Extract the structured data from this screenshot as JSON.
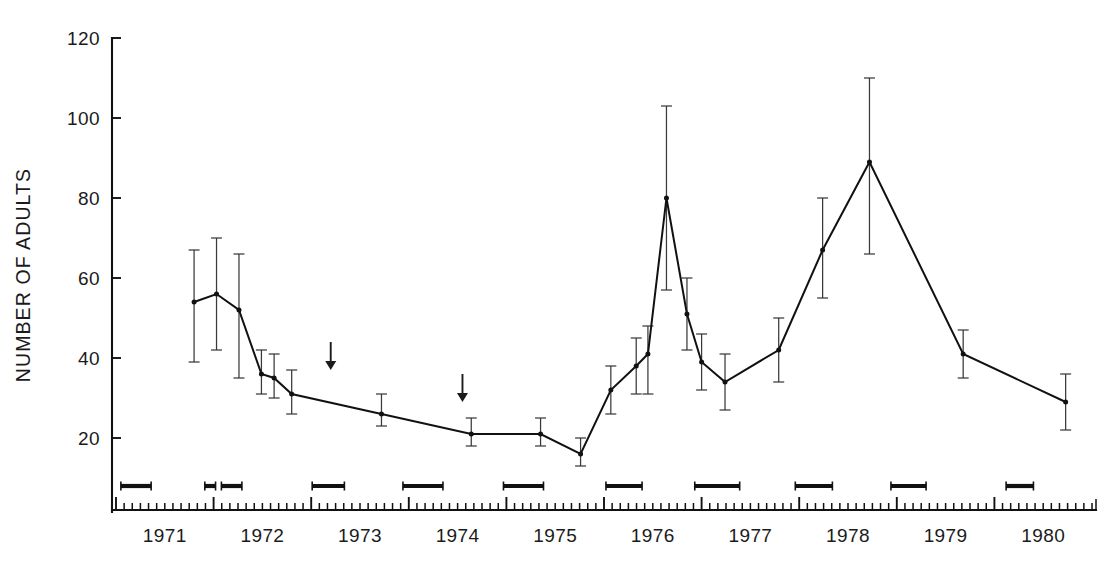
{
  "chart_data": {
    "type": "line",
    "title": "",
    "xlabel": "",
    "ylabel": "NUMBER OF ADULTS",
    "ylim": [
      0,
      120
    ],
    "xlim": [
      1971.0,
      1981.0
    ],
    "grid": false,
    "legend": null,
    "y_ticks": [
      0,
      20,
      40,
      60,
      80,
      100,
      120
    ],
    "y_tick_labels": [
      "",
      "20",
      "40",
      "60",
      "80",
      "100",
      "120"
    ],
    "x_ticks": [
      1971,
      1972,
      1973,
      1974,
      1975,
      1976,
      1977,
      1978,
      1979,
      1980
    ],
    "x_tick_labels": [
      "1971",
      "1972",
      "1973",
      "1974",
      "1975",
      "1976",
      "1977",
      "1978",
      "1979",
      "1980"
    ],
    "x_minor_tick_interval_months": 1,
    "series": [
      {
        "name": "Number of adults",
        "marker": "filled-circle",
        "error_type": "95% confidence interval",
        "points": [
          {
            "x": 1971.8,
            "y": 54,
            "yerr_low": 39,
            "yerr_high": 67
          },
          {
            "x": 1972.03,
            "y": 56,
            "yerr_low": 42,
            "yerr_high": 70
          },
          {
            "x": 1972.26,
            "y": 52,
            "yerr_low": 35,
            "yerr_high": 66
          },
          {
            "x": 1972.49,
            "y": 36,
            "yerr_low": 31,
            "yerr_high": 42
          },
          {
            "x": 1972.62,
            "y": 35,
            "yerr_low": 30,
            "yerr_high": 41
          },
          {
            "x": 1972.8,
            "y": 31,
            "yerr_low": 26,
            "yerr_high": 37
          },
          {
            "x": 1973.72,
            "y": 26,
            "yerr_low": 23,
            "yerr_high": 31
          },
          {
            "x": 1974.64,
            "y": 21,
            "yerr_low": 18,
            "yerr_high": 25
          },
          {
            "x": 1975.35,
            "y": 21,
            "yerr_low": 18,
            "yerr_high": 25
          },
          {
            "x": 1975.76,
            "y": 16,
            "yerr_low": 13,
            "yerr_high": 20
          },
          {
            "x": 1976.07,
            "y": 32,
            "yerr_low": 26,
            "yerr_high": 38
          },
          {
            "x": 1976.33,
            "y": 38,
            "yerr_low": 31,
            "yerr_high": 45
          },
          {
            "x": 1976.45,
            "y": 41,
            "yerr_low": 31,
            "yerr_high": 48
          },
          {
            "x": 1976.64,
            "y": 80,
            "yerr_low": 57,
            "yerr_high": 103
          },
          {
            "x": 1976.85,
            "y": 51,
            "yerr_low": 42,
            "yerr_high": 60
          },
          {
            "x": 1977.0,
            "y": 39,
            "yerr_low": 32,
            "yerr_high": 46
          },
          {
            "x": 1977.24,
            "y": 34,
            "yerr_low": 27,
            "yerr_high": 41
          },
          {
            "x": 1977.79,
            "y": 42,
            "yerr_low": 34,
            "yerr_high": 50
          },
          {
            "x": 1978.24,
            "y": 67,
            "yerr_low": 55,
            "yerr_high": 80
          },
          {
            "x": 1978.72,
            "y": 89,
            "yerr_low": 66,
            "yerr_high": 110
          },
          {
            "x": 1979.68,
            "y": 41,
            "yerr_low": 35,
            "yerr_high": 47
          },
          {
            "x": 1980.73,
            "y": 29,
            "yerr_low": 22,
            "yerr_high": 36
          }
        ]
      }
    ],
    "annotations": {
      "arrows": [
        {
          "name": "arrow-marker-1",
          "x": 1973.2,
          "y_tip": 37,
          "y_tail": 44,
          "direction": "down"
        },
        {
          "name": "arrow-marker-2",
          "x": 1974.55,
          "y_tip": 29,
          "y_tail": 36,
          "direction": "down"
        }
      ],
      "period_bars": {
        "description": "Horizontal sampling-period bars plotted near baseline",
        "y": 8,
        "intervals": [
          {
            "x_start": 1971.05,
            "x_end": 1971.36
          },
          {
            "x_start": 1971.91,
            "x_end": 1972.02
          },
          {
            "x_start": 1972.08,
            "x_end": 1972.29
          },
          {
            "x_start": 1973.01,
            "x_end": 1973.34
          },
          {
            "x_start": 1973.94,
            "x_end": 1974.35
          },
          {
            "x_start": 1974.97,
            "x_end": 1975.38
          },
          {
            "x_start": 1976.02,
            "x_end": 1976.39
          },
          {
            "x_start": 1976.93,
            "x_end": 1977.39
          },
          {
            "x_start": 1977.96,
            "x_end": 1978.34
          },
          {
            "x_start": 1978.94,
            "x_end": 1979.3
          },
          {
            "x_start": 1980.12,
            "x_end": 1980.4
          }
        ]
      }
    },
    "colors": {
      "line": "#111111",
      "errorbar": "#3a3a3a",
      "axis": "#111111",
      "background": "#ffffff"
    }
  }
}
